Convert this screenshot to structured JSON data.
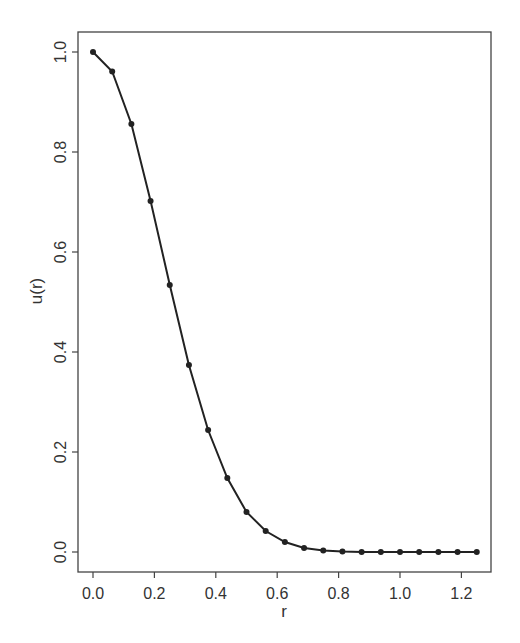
{
  "chart_data": {
    "type": "line",
    "title": "",
    "xlabel": "r",
    "ylabel": "u(r)",
    "xlim": [
      -0.05,
      1.29
    ],
    "ylim": [
      -0.04,
      1.04
    ],
    "grid": false,
    "legend": null,
    "markers": true,
    "x_ticks": [
      0.0,
      0.2,
      0.4,
      0.6,
      0.8,
      1.0,
      1.2
    ],
    "x_tick_labels": [
      "0.0",
      "0.2",
      "0.4",
      "0.6",
      "0.8",
      "1.0",
      "1.2"
    ],
    "y_ticks": [
      0.0,
      0.2,
      0.4,
      0.6,
      0.8,
      1.0
    ],
    "y_tick_labels": [
      "0.0",
      "0.2",
      "0.4",
      "0.6",
      "0.8",
      "1.0"
    ],
    "series": [
      {
        "name": "u(r)",
        "color": "#222222",
        "x": [
          0.0,
          0.0625,
          0.125,
          0.1875,
          0.25,
          0.3125,
          0.375,
          0.4375,
          0.5,
          0.5625,
          0.625,
          0.6875,
          0.75,
          0.8125,
          0.875,
          0.9375,
          1.0,
          1.0625,
          1.125,
          1.1875,
          1.25
        ],
        "values": [
          1.0,
          0.961,
          0.856,
          0.702,
          0.534,
          0.374,
          0.244,
          0.148,
          0.08,
          0.042,
          0.02,
          0.008,
          0.003,
          0.001,
          0.0,
          0.0,
          0.0,
          0.0,
          0.0,
          0.0,
          0.0
        ]
      }
    ]
  },
  "layout": {
    "frame": {
      "left": 78,
      "top": 32,
      "right": 491,
      "bottom": 572
    },
    "x_origin_px": 93,
    "x_scale_px": 307,
    "y_origin_px": 552,
    "y_scale_px": 500
  }
}
